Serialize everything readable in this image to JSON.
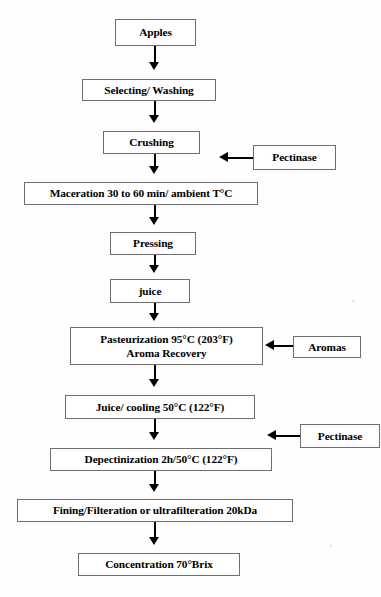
{
  "figure": {
    "type": "process-flow-diagram",
    "title_fragment_top_cropped": ""
  },
  "nodes": [
    {
      "id": "apples",
      "label": "Apples",
      "lines": [
        "Apples"
      ],
      "x": 115,
      "y": 19,
      "w": 81,
      "h": 27,
      "kind": "process"
    },
    {
      "id": "selecting",
      "label": "Selecting/ Washing",
      "lines": [
        "Selecting/ Washing"
      ],
      "x": 82,
      "y": 79,
      "w": 134,
      "h": 22,
      "kind": "process"
    },
    {
      "id": "crushing",
      "label": "Crushing",
      "lines": [
        "Crushing"
      ],
      "x": 103,
      "y": 131,
      "w": 97,
      "h": 23,
      "kind": "process"
    },
    {
      "id": "maceration",
      "label": "Maceration 30 to 60 min/ ambient T°C",
      "lines": [
        "Maceration 30 to 60 min/ ambient T°C"
      ],
      "x": 24,
      "y": 182,
      "w": 234,
      "h": 23,
      "kind": "process"
    },
    {
      "id": "pressing",
      "label": "Pressing",
      "lines": [
        "Pressing"
      ],
      "x": 110,
      "y": 232,
      "w": 86,
      "h": 23,
      "kind": "process"
    },
    {
      "id": "juice",
      "label": "juice",
      "lines": [
        "juice"
      ],
      "x": 110,
      "y": 279,
      "w": 80,
      "h": 24,
      "kind": "process"
    },
    {
      "id": "pasteurization",
      "label": "Pasteurization 95°C (203°F) Aroma Recovery",
      "lines": [
        "Pasteurization 95°C (203°F)",
        "Aroma Recovery"
      ],
      "x": 70,
      "y": 327,
      "w": 193,
      "h": 38,
      "kind": "process"
    },
    {
      "id": "cooling",
      "label": "Juice/ cooling 50°C (122°F)",
      "lines": [
        "Juice/ cooling 50°C (122°F)"
      ],
      "x": 65,
      "y": 395,
      "w": 190,
      "h": 24,
      "kind": "process"
    },
    {
      "id": "depectinization",
      "label": "Depectinization 2h/50°C (122°F)",
      "lines": [
        "Depectinization 2h/50°C (122°F)"
      ],
      "x": 50,
      "y": 448,
      "w": 222,
      "h": 23,
      "kind": "process"
    },
    {
      "id": "fining",
      "label": "Fining/Filteration or ultrafilteration 20kDa",
      "lines": [
        "Fining/Filteration or ultrafilteration 20kDa"
      ],
      "x": 17,
      "y": 499,
      "w": 276,
      "h": 23,
      "kind": "process"
    },
    {
      "id": "concentration",
      "label": "Concentration 70°Brix",
      "lines": [
        "Concentration 70°Brix"
      ],
      "x": 78,
      "y": 553,
      "w": 162,
      "h": 23,
      "kind": "process"
    }
  ],
  "inputs": [
    {
      "id": "pectinase-1",
      "label": "Pectinase",
      "x": 253,
      "y": 145,
      "w": 83,
      "h": 25,
      "target": "maceration"
    },
    {
      "id": "aromas",
      "label": "Aromas",
      "x": 293,
      "y": 336,
      "w": 68,
      "h": 22,
      "target": "pasteurization"
    },
    {
      "id": "pectinase-2",
      "label": "Pectinase",
      "x": 300,
      "y": 424,
      "w": 80,
      "h": 24,
      "target": "depectinization"
    }
  ],
  "connectors": {
    "vertical": [
      {
        "from": "apples",
        "to": "selecting",
        "x": 155,
        "y": 46,
        "len": 24
      },
      {
        "from": "selecting",
        "to": "crushing",
        "x": 155,
        "y": 101,
        "len": 22
      },
      {
        "from": "crushing",
        "to": "maceration",
        "x": 155,
        "y": 154,
        "len": 20
      },
      {
        "from": "maceration",
        "to": "pressing",
        "x": 155,
        "y": 205,
        "len": 19
      },
      {
        "from": "pressing",
        "to": "juice",
        "x": 155,
        "y": 255,
        "len": 16
      },
      {
        "from": "juice",
        "to": "pasteurization",
        "x": 155,
        "y": 303,
        "len": 16
      },
      {
        "from": "pasteurization",
        "to": "cooling",
        "x": 155,
        "y": 365,
        "len": 22
      },
      {
        "from": "cooling",
        "to": "depectinization",
        "x": 155,
        "y": 419,
        "len": 21
      },
      {
        "from": "depectinization",
        "to": "fining",
        "x": 155,
        "y": 471,
        "len": 20
      },
      {
        "from": "fining",
        "to": "concentration",
        "x": 155,
        "y": 522,
        "len": 23
      }
    ],
    "horizontal": [
      {
        "from": "pectinase-1",
        "to": "maceration",
        "y": 158,
        "x_start": 218,
        "x_end": 252
      },
      {
        "from": "aromas",
        "to": "pasteurization",
        "y": 346,
        "x_start": 264,
        "x_end": 292
      },
      {
        "from": "pectinase-2",
        "to": "depectinization",
        "y": 436,
        "x_start": 266,
        "x_end": 299
      }
    ]
  },
  "colors": {
    "box_border": "#6f6f6f",
    "arrow": "#000000",
    "text": "#000000",
    "background": "#fefefe"
  }
}
